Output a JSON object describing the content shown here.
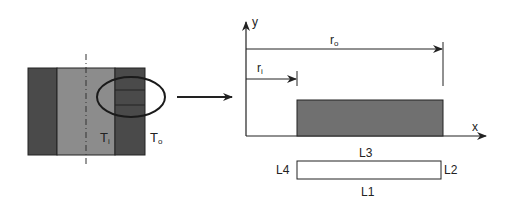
{
  "left_figure": {
    "labels": {
      "inner_temp": "T",
      "inner_sub": "i",
      "outer_temp": "T",
      "outer_sub": "o"
    },
    "colors": {
      "dark": "#4a4a4a",
      "light": "#8c8c8c",
      "outline": "#222222"
    }
  },
  "right_figure": {
    "axes": {
      "x_label": "x",
      "y_label": "y"
    },
    "dimensions": {
      "outer_radius": "r",
      "outer_sub": "o",
      "inner_radius": "r",
      "inner_sub": "i"
    },
    "region_color": "#707070",
    "boundaries": {
      "top": "L3",
      "right": "L2",
      "bottom": "L1",
      "left": "L4"
    }
  }
}
